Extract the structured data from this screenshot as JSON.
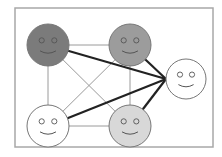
{
  "diagram": {
    "type": "network-of-smiley-faces",
    "frame": {
      "x": 15,
      "y": 8,
      "w": 198,
      "h": 139,
      "stroke": "#a8a8a8"
    },
    "nodes": [
      {
        "id": "A",
        "cx": 48,
        "cy": 45,
        "r": 21,
        "fill": "#7b7b7b",
        "label": "dark-gray-face"
      },
      {
        "id": "B",
        "cx": 130,
        "cy": 45,
        "r": 21,
        "fill": "#9c9c9c",
        "label": "mid-gray-face"
      },
      {
        "id": "C",
        "cx": 48,
        "cy": 126,
        "r": 21,
        "fill": "#ffffff",
        "label": "white-face-left"
      },
      {
        "id": "D",
        "cx": 130,
        "cy": 126,
        "r": 21,
        "fill": "#d8d8d8",
        "label": "light-gray-face"
      },
      {
        "id": "E",
        "cx": 186,
        "cy": 79,
        "r": 20,
        "fill": "#ffffff",
        "label": "white-face-right"
      }
    ],
    "thin_edges": [
      [
        "A",
        "B"
      ],
      [
        "A",
        "C"
      ],
      [
        "A",
        "D"
      ],
      [
        "B",
        "C"
      ],
      [
        "B",
        "D"
      ],
      [
        "C",
        "D"
      ]
    ],
    "thick_edges": [
      [
        "A",
        "E"
      ],
      [
        "B",
        "E"
      ],
      [
        "C",
        "E"
      ],
      [
        "D",
        "E"
      ]
    ],
    "thin_color": "#9a9a9a",
    "thick_color": "#222222"
  }
}
